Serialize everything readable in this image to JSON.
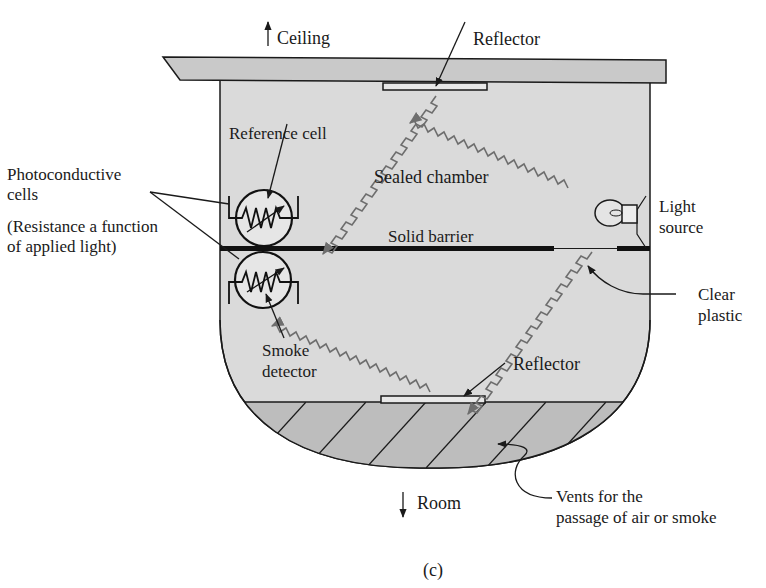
{
  "figure": {
    "caption": "(c)",
    "colors": {
      "housing_fill": "#dadada",
      "ceiling_fill": "#c9c9c9",
      "vent_fill": "#bdbdbd",
      "outline": "#1a1a1a",
      "light_ray": "#6e6e6e",
      "background": "#ffffff"
    }
  },
  "labels": {
    "ceiling": "Ceiling",
    "room": "Room",
    "reflector_top": "Reflector",
    "reflector_bottom": "Reflector",
    "reference_cell": "Reference cell",
    "sealed_chamber": "Sealed chamber",
    "solid_barrier": "Solid barrier",
    "photoconductive_line1": "Photoconductive",
    "photoconductive_line2": "cells",
    "resistance_line1": "(Resistance a function",
    "resistance_line2": "of applied light)",
    "light_source_line1": "Light",
    "light_source_line2": "source",
    "clear_plastic_line1": "Clear",
    "clear_plastic_line2": "plastic",
    "smoke_detector_line1": "Smoke",
    "smoke_detector_line2": "detector",
    "vents_line1": "Vents for the",
    "vents_line2": "passage of air or smoke"
  },
  "components": [
    {
      "id": "reference-cell",
      "type": "photoconductive-cell",
      "position": "above barrier"
    },
    {
      "id": "smoke-detector-cell",
      "type": "photoconductive-cell",
      "position": "below barrier"
    },
    {
      "id": "light-source",
      "type": "lamp",
      "position": "right wall at barrier"
    },
    {
      "id": "top-reflector",
      "type": "reflector",
      "position": "ceiling"
    },
    {
      "id": "bottom-reflector",
      "type": "reflector",
      "position": "above vents"
    }
  ]
}
